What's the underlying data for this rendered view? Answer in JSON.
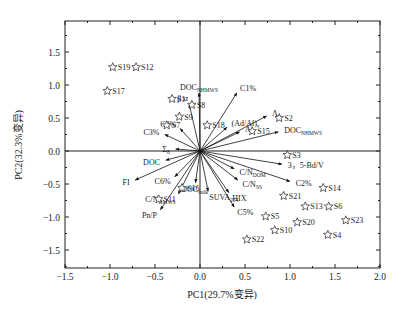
{
  "chart_data": {
    "type": "scatter",
    "subtype": "pca-biplot",
    "title": "",
    "xlabel": "PC1(29.7%变异)",
    "ylabel": "PC2(32.3%变异)",
    "xlim": [
      -1.5,
      2.0
    ],
    "ylim": [
      -1.8,
      1.95
    ],
    "xticks": [
      -1.5,
      -1.0,
      -0.5,
      0.0,
      0.5,
      1.0,
      1.5,
      2.0
    ],
    "xtick_labels": [
      "−1.5",
      "−1.0",
      "−0.5",
      "0.0",
      "0.5",
      "1.0",
      "1.5",
      "2.0"
    ],
    "yticks": [
      -1.5,
      -1.0,
      -0.5,
      0.0,
      0.5,
      1.0,
      1.5
    ],
    "ytick_labels": [
      "−1.5",
      "−1.0",
      "−0.5",
      "0.0",
      "0.5",
      "1.0",
      "1.5"
    ],
    "grid": false,
    "legend": null,
    "reference_lines": {
      "x0": true,
      "y0": true
    },
    "marker": "open-star",
    "samples": [
      {
        "label": "S19",
        "x": -0.97,
        "y": 1.27
      },
      {
        "label": "S12",
        "x": -0.71,
        "y": 1.27
      },
      {
        "label": "S17",
        "x": -1.03,
        "y": 0.91
      },
      {
        "label": "S1",
        "x": -0.31,
        "y": 0.79
      },
      {
        "label": "S8",
        "x": -0.09,
        "y": 0.7
      },
      {
        "label": "S9",
        "x": -0.23,
        "y": 0.52
      },
      {
        "label": "S7",
        "x": -0.37,
        "y": 0.39
      },
      {
        "label": "S18",
        "x": 0.08,
        "y": 0.39
      },
      {
        "label": "S2",
        "x": 0.88,
        "y": 0.5
      },
      {
        "label": "S15",
        "x": 0.58,
        "y": 0.3
      },
      {
        "label": "S3",
        "x": 0.97,
        "y": -0.06
      },
      {
        "label": "S14",
        "x": 1.37,
        "y": -0.56
      },
      {
        "label": "S21",
        "x": 0.93,
        "y": -0.68
      },
      {
        "label": "S13",
        "x": 1.17,
        "y": -0.84
      },
      {
        "label": "S6",
        "x": 1.43,
        "y": -0.84
      },
      {
        "label": "S5",
        "x": 0.73,
        "y": -0.99
      },
      {
        "label": "S20",
        "x": 1.08,
        "y": -1.08
      },
      {
        "label": "S23",
        "x": 1.62,
        "y": -1.05
      },
      {
        "label": "S10",
        "x": 0.83,
        "y": -1.2
      },
      {
        "label": "S4",
        "x": 1.42,
        "y": -1.27
      },
      {
        "label": "S22",
        "x": 0.52,
        "y": -1.34
      },
      {
        "label": "S16",
        "x": -0.2,
        "y": -0.56
      },
      {
        "label": "S11",
        "x": -0.46,
        "y": -0.73
      }
    ],
    "loadings": [
      {
        "label": "DOC",
        "sub": "NHMWS",
        "x": -0.01,
        "y": 0.88
      },
      {
        "label": "C1%",
        "sub": "",
        "x": 0.41,
        "y": 0.88
      },
      {
        "label": "β:α",
        "sub": "",
        "x": -0.12,
        "y": 0.71
      },
      {
        "label": "(Ad/Al)",
        "sub": "v",
        "x": 0.3,
        "y": 0.36
      },
      {
        "label": "Λ",
        "sub": "v",
        "x": 0.74,
        "y": 0.53
      },
      {
        "label": "Λ",
        "sub": "8",
        "x": 0.44,
        "y": 0.29
      },
      {
        "label": "DOC",
        "sub": "NHMWS",
        "x": 0.87,
        "y": 0.29
      },
      {
        "label": "C4%",
        "sub": "",
        "x": -0.22,
        "y": 0.34
      },
      {
        "label": "C3%",
        "sub": "",
        "x": -0.39,
        "y": 0.25
      },
      {
        "label": "Σ",
        "sub": "8",
        "x": -0.27,
        "y": 0.03
      },
      {
        "label": "DOC",
        "sub": "",
        "x": -0.38,
        "y": -0.14
      },
      {
        "label": "FI",
        "sub": "",
        "x": -0.72,
        "y": -0.44
      },
      {
        "label": "C6%",
        "sub": "",
        "x": -0.28,
        "y": -0.39
      },
      {
        "label": "Pn/P",
        "sub": "",
        "x": -0.44,
        "y": -0.89
      },
      {
        "label": "C/N",
        "sub": "HMWS",
        "x": -0.24,
        "y": -0.65
      },
      {
        "label": "DOC",
        "sub": "bulk",
        "x": -0.05,
        "y": -0.48
      },
      {
        "label": "SUVA",
        "sub": "254",
        "x": 0.09,
        "y": -0.61
      },
      {
        "label": "HIX",
        "sub": "",
        "x": 0.32,
        "y": -0.63
      },
      {
        "label": "C5%",
        "sub": "",
        "x": 0.38,
        "y": -0.85
      },
      {
        "label": "C/N",
        "sub": "SS",
        "x": 0.42,
        "y": -0.44
      },
      {
        "label": "C/N",
        "sub": "DOM",
        "x": 0.38,
        "y": -0.27
      },
      {
        "label": "3，5-Bd/V",
        "sub": "",
        "x": 0.91,
        "y": -0.2
      },
      {
        "label": "C2%",
        "sub": "",
        "x": 1.0,
        "y": -0.46
      }
    ]
  }
}
